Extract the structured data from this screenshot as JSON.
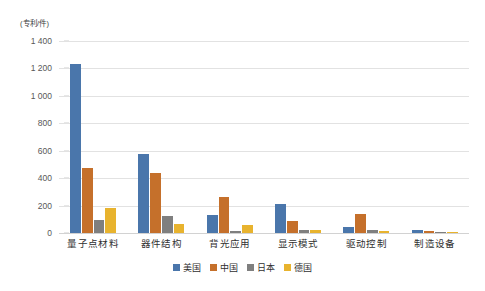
{
  "chart_data": {
    "type": "bar",
    "title": "",
    "subtitle": "",
    "xlabel": "",
    "ylabel": "(专利/件)",
    "ylim": [
      0,
      1400
    ],
    "ytick_values": [
      0,
      200,
      400,
      600,
      800,
      1000,
      1200,
      1400
    ],
    "ytick_labels": [
      "0",
      "200",
      "400",
      "600",
      "800",
      "1 000",
      "1 200",
      "1 400"
    ],
    "grid": true,
    "legend_position": "bottom",
    "categories": [
      "量子点材料",
      "器件结构",
      "背光应用",
      "显示模式",
      "驱动控制",
      "制造设备"
    ],
    "series": [
      {
        "name": "美国",
        "color": "#4a76ab",
        "values": [
          1232,
          575,
          130,
          212,
          45,
          22
        ]
      },
      {
        "name": "中国",
        "color": "#c5702b",
        "values": [
          475,
          440,
          265,
          85,
          138,
          14
        ]
      },
      {
        "name": "日本",
        "color": "#7f7f7f",
        "values": [
          98,
          122,
          14,
          24,
          20,
          9
        ]
      },
      {
        "name": "德国",
        "color": "#e8b32e",
        "values": [
          182,
          68,
          62,
          24,
          12,
          9
        ]
      }
    ]
  }
}
